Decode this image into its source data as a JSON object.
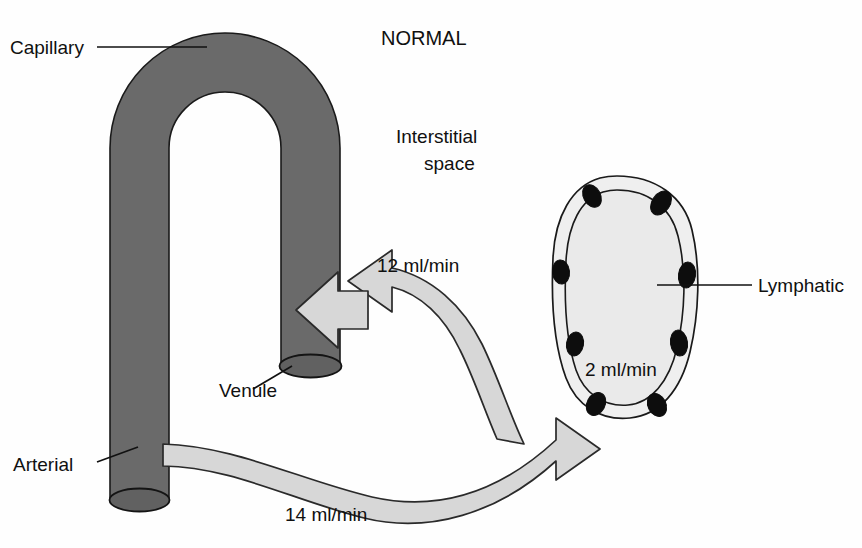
{
  "figure": {
    "title": "NORMAL",
    "region_label_line1": "Interstitial",
    "region_label_line2": "space",
    "background_color": "#fefefe"
  },
  "labels": {
    "capillary": "Capillary",
    "venule": "Venule",
    "arterial": "Arterial",
    "lymphatic": "Lymphatic"
  },
  "flows": [
    {
      "id": "outflow",
      "value": "14 ml/min",
      "from": "Arterial",
      "to": "Interstitial space"
    },
    {
      "id": "reabsorption",
      "value": "12 ml/min",
      "from": "Interstitial space",
      "to": "Venule"
    },
    {
      "id": "lymph-drainage",
      "value": "2 ml/min",
      "from": "Interstitial space",
      "to": "Lymphatic"
    }
  ],
  "flow_values": {
    "arterial_out": "14 ml/min",
    "venule_in": "12 ml/min",
    "lymphatic_in": "2 ml/min"
  },
  "colors": {
    "vessel_gray": "#6a6a6a",
    "flow_gray": "#d7d7d7",
    "lymph_fill": "#efefef",
    "outline": "#1a1a1a",
    "text": "#101010"
  }
}
